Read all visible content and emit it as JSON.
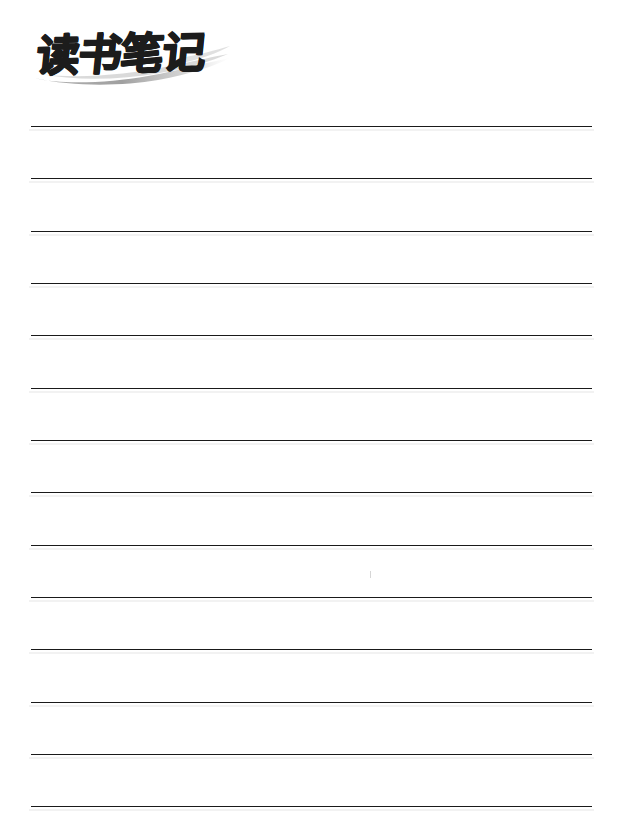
{
  "page": {
    "title": "读书笔记",
    "title_romanization": "Dushu Biji",
    "title_meaning": "Reading Notes",
    "background_color": "#ffffff",
    "width": 619,
    "height": 827
  },
  "heading": {
    "text": "读书笔记",
    "color": "#1c1c1c",
    "style": "brush-calligraphy-bold-italic",
    "decoration_name": "brush-swoosh",
    "decoration_color": "#b0b0b0"
  },
  "ruled_lines": {
    "count": 14,
    "color": "#1a1a1a",
    "thickness_px": 1.6,
    "left_px": 31,
    "right_px": 592,
    "width_px": 561,
    "first_line_y_px": 126,
    "spacing_px": 52.3,
    "y_positions": [
      126,
      178,
      231,
      283,
      335,
      388,
      440,
      492,
      545,
      597,
      649,
      702,
      754,
      806
    ]
  },
  "artifacts": {
    "tick_mark": {
      "name": "scan-artifact-tick",
      "x_px": 370,
      "y_px": 571,
      "color": "rgba(0,0,0,0.16)"
    }
  }
}
